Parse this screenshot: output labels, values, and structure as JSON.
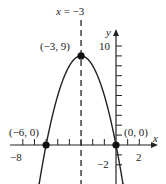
{
  "chart_data": {
    "type": "line",
    "title": "",
    "equation_hint": "parabola opening downward with vertex (-3, 9), x-intercepts (-6, 0) and (0, 0)",
    "xlabel": "x",
    "ylabel": "y",
    "xlim": [
      -9,
      3.5
    ],
    "ylim": [
      -3,
      11.5
    ],
    "grid": false,
    "x_tick_step": 1,
    "y_tick_step": 1,
    "x_tick_labels": [
      {
        "value": -8,
        "label": "−8"
      },
      {
        "value": 2,
        "label": "2"
      }
    ],
    "y_tick_labels": [
      {
        "value": 10,
        "label": "10"
      },
      {
        "value": -2,
        "label": "−2"
      }
    ],
    "series": [
      {
        "name": "parabola",
        "x": [
          -6.6,
          -6,
          -5,
          -4,
          -3,
          -2,
          -1,
          0,
          0.6
        ],
        "y": [
          -3.96,
          0,
          5,
          8,
          9,
          8,
          5,
          0,
          -3.96
        ],
        "arrows_at_ends": true
      }
    ],
    "axis_of_symmetry": {
      "x": -3,
      "label": "x = −3",
      "style": "dashed"
    },
    "points": [
      {
        "x": -3,
        "y": 9,
        "label": "(−3, 9)"
      },
      {
        "x": -6,
        "y": 0,
        "label": "(−6, 0)"
      },
      {
        "x": 0,
        "y": 0,
        "label": "(0, 0)"
      }
    ]
  },
  "labels": {
    "axis_of_symmetry": "x = −3",
    "vertex": "(−3, 9)",
    "left_intercept": "(−6, 0)",
    "origin": "(0, 0)",
    "x_axis": "x",
    "y_axis": "y",
    "tick_neg8": "−8",
    "tick_2": "2",
    "tick_10": "10",
    "tick_neg2": "−2"
  }
}
